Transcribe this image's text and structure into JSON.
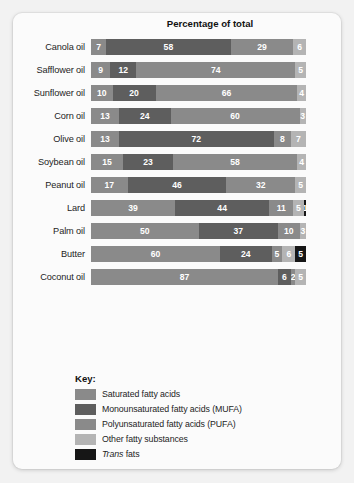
{
  "chart_data": {
    "type": "bar",
    "subtype": "stacked-horizontal-100",
    "title": "",
    "xlabel": "Percentage of total",
    "ylabel": "",
    "xlim": [
      0,
      100
    ],
    "grid": false,
    "legend_position": "bottom-left",
    "categories": [
      "Canola oil",
      "Safflower oil",
      "Sunflower oil",
      "Corn oil",
      "Olive oil",
      "Soybean oil",
      "Peanut oil",
      "Lard",
      "Palm oil",
      "Butter",
      "Coconut oil"
    ],
    "series": [
      {
        "name": "Saturated fatty acids",
        "color": "#8a8a8a",
        "values": [
          7,
          9,
          10,
          13,
          13,
          15,
          17,
          39,
          50,
          60,
          87
        ]
      },
      {
        "name": "Monounsaturated fatty acids (MUFA)",
        "color": "#5e5e5e",
        "values": [
          58,
          12,
          20,
          24,
          72,
          23,
          46,
          44,
          37,
          24,
          6
        ]
      },
      {
        "name": "Polyunsaturated fatty acids (PUFA)",
        "color": "#8a8a8a",
        "values": [
          29,
          74,
          66,
          60,
          8,
          58,
          32,
          11,
          10,
          5,
          2
        ]
      },
      {
        "name": "Other fatty substances",
        "color": "#b4b4b4",
        "values": [
          6,
          5,
          4,
          3,
          7,
          4,
          5,
          5,
          3,
          6,
          5
        ]
      },
      {
        "name": "Trans fats",
        "color": "#161616",
        "values": [
          0,
          0,
          0,
          0,
          0,
          0,
          0,
          1,
          0,
          5,
          0
        ]
      }
    ],
    "rows": [
      {
        "label": "Canola oil",
        "segments": [
          7,
          58,
          29,
          6
        ]
      },
      {
        "label": "Safflower oil",
        "segments": [
          9,
          12,
          74,
          5
        ]
      },
      {
        "label": "Sunflower oil",
        "segments": [
          10,
          20,
          66,
          4
        ]
      },
      {
        "label": "Corn oil",
        "segments": [
          13,
          24,
          60,
          3
        ]
      },
      {
        "label": "Olive oil",
        "segments": [
          13,
          72,
          8,
          7
        ]
      },
      {
        "label": "Soybean oil",
        "segments": [
          15,
          23,
          58,
          4
        ]
      },
      {
        "label": "Peanut oil",
        "segments": [
          17,
          46,
          32,
          5
        ]
      },
      {
        "label": "Lard",
        "segments": [
          39,
          44,
          11,
          5,
          1
        ]
      },
      {
        "label": "Palm oil",
        "segments": [
          50,
          37,
          10,
          3
        ]
      },
      {
        "label": "Butter",
        "segments": [
          60,
          24,
          5,
          6,
          5
        ]
      },
      {
        "label": "Coconut oil",
        "segments": [
          87,
          6,
          2,
          5
        ]
      }
    ]
  },
  "key": {
    "title": "Key:",
    "items": [
      {
        "label": "Saturated fatty acids",
        "color": "#8a8a8a",
        "italic_prefix": ""
      },
      {
        "label": "Monounsaturated fatty acids (MUFA)",
        "color": "#5e5e5e",
        "italic_prefix": ""
      },
      {
        "label": "Polyunsaturated fatty acids (PUFA)",
        "color": "#8a8a8a",
        "italic_prefix": ""
      },
      {
        "label": "Other fatty substances",
        "color": "#b4b4b4",
        "italic_prefix": ""
      },
      {
        "label": "fats",
        "color": "#161616",
        "italic_prefix": "Trans"
      }
    ]
  }
}
